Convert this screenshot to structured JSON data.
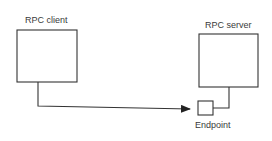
{
  "diagram": {
    "nodes": [
      {
        "id": "client",
        "label": "RPC client",
        "x": 17,
        "y": 30,
        "w": 60,
        "h": 52
      },
      {
        "id": "server",
        "label": "RPC server",
        "x": 199,
        "y": 34,
        "w": 59,
        "h": 53
      },
      {
        "id": "endpoint",
        "label": "Endpoint",
        "x": 198,
        "y": 101,
        "w": 15,
        "h": 14
      }
    ],
    "edges": [
      {
        "from": "client",
        "to": "endpoint",
        "style": "arrow"
      },
      {
        "from": "server",
        "to": "endpoint",
        "style": "line"
      }
    ]
  },
  "labels": {
    "client": "RPC client",
    "server": "RPC server",
    "endpoint": "Endpoint"
  },
  "colors": {
    "stroke": "#333333",
    "text": "#3a3a3a",
    "background": "#ffffff"
  }
}
